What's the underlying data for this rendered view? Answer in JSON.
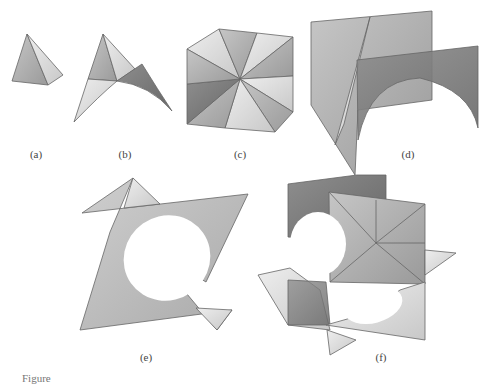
{
  "figure": {
    "panels": [
      {
        "id": "a",
        "label": "(a)",
        "description": "single pyramid (tetrahedral corner piece)"
      },
      {
        "id": "b",
        "label": "(b)",
        "description": "pyramid with attached saddle surface"
      },
      {
        "id": "c",
        "label": "(c)",
        "description": "hexagonal arrangement of eight triangular facets around a center vertex"
      },
      {
        "id": "d",
        "label": "(d)",
        "description": "two offset vertical panels with arch-shaped cutout"
      },
      {
        "id": "e",
        "label": "(e)",
        "description": "star-shaped assembly of two triangles with circular opening"
      },
      {
        "id": "f",
        "label": "(f)",
        "description": "intersecting square panels with saddle surfaces and circular openings"
      }
    ],
    "caption_partial": "Figure"
  },
  "colors": {
    "background": "#ffffff",
    "light_face": "#e0e0e0",
    "mid_face": "#b4b4b4",
    "dark_face": "#7c7c7c",
    "edge": "#666666"
  }
}
